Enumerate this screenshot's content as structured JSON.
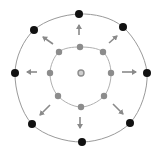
{
  "diagram": {
    "title": "",
    "type": "radial-expansion",
    "canvas": {
      "width": 157,
      "height": 155,
      "background": "#ffffff"
    },
    "colors": {
      "outer_ring_stroke": "#9a9a9a",
      "inner_ring_stroke": "#b0b0b0",
      "outer_dot": "#111111",
      "inner_dot": "#8c8c8c",
      "center_dot": "#8c8c8c",
      "arrow": "#8a8a8a"
    },
    "center": {
      "x": 81,
      "y": 73,
      "r": 3
    },
    "inner_ring": {
      "cx": 81,
      "cy": 76,
      "rx": 30,
      "ry": 30,
      "dots": [
        {
          "x": 80,
          "y": 47
        },
        {
          "x": 103,
          "y": 52
        },
        {
          "x": 111,
          "y": 73
        },
        {
          "x": 104,
          "y": 96
        },
        {
          "x": 81,
          "y": 107
        },
        {
          "x": 58,
          "y": 96
        },
        {
          "x": 50,
          "y": 73
        },
        {
          "x": 59,
          "y": 52
        }
      ],
      "dot_r": 3.2
    },
    "outer_ring": {
      "dots": [
        {
          "x": 79,
          "y": 14
        },
        {
          "x": 123,
          "y": 27
        },
        {
          "x": 147,
          "y": 73
        },
        {
          "x": 130,
          "y": 123
        },
        {
          "x": 82,
          "y": 142
        },
        {
          "x": 32,
          "y": 124
        },
        {
          "x": 15,
          "y": 73
        },
        {
          "x": 34,
          "y": 30
        }
      ],
      "dot_r": 4
    },
    "arrows": [
      {
        "direction": "up",
        "x1": 79,
        "y1": 35,
        "x2": 79,
        "y2": 25
      },
      {
        "direction": "up-right",
        "x1": 109,
        "y1": 43,
        "x2": 117,
        "y2": 36
      },
      {
        "direction": "right",
        "x1": 122,
        "y1": 72,
        "x2": 136,
        "y2": 72
      },
      {
        "direction": "down-right",
        "x1": 113,
        "y1": 104,
        "x2": 123,
        "y2": 114
      },
      {
        "direction": "down",
        "x1": 80,
        "y1": 117,
        "x2": 80,
        "y2": 128
      },
      {
        "direction": "down-left",
        "x1": 50,
        "y1": 105,
        "x2": 40,
        "y2": 115
      },
      {
        "direction": "left",
        "x1": 37,
        "y1": 72,
        "x2": 27,
        "y2": 72
      },
      {
        "direction": "up-left",
        "x1": 53,
        "y1": 44,
        "x2": 43,
        "y2": 37
      }
    ]
  }
}
